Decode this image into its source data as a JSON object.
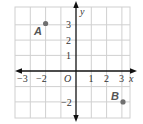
{
  "diagram": {
    "type": "coordinate-plane",
    "x_axis": {
      "label": "x",
      "min": -4,
      "max": 3.5,
      "tick_labels": [
        "−3",
        "−2",
        "1",
        "2",
        "3"
      ]
    },
    "y_axis": {
      "label": "y",
      "min": -3,
      "max": 4,
      "tick_labels": [
        "3",
        "2",
        "1",
        "−2"
      ]
    },
    "origin_label": "O",
    "points": [
      {
        "name": "A",
        "x": -2,
        "y": 3
      },
      {
        "name": "B",
        "x": 3,
        "y": -2
      }
    ],
    "colors": {
      "grid": "#d0d0d0",
      "axis": "#111111",
      "point": "#707070"
    }
  }
}
